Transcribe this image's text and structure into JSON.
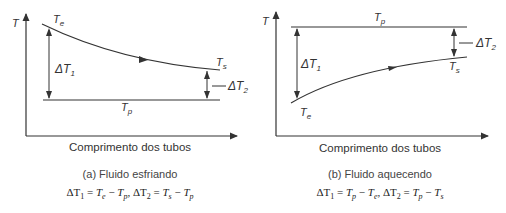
{
  "panels": [
    {
      "id": "a",
      "y_axis_label": "T",
      "x_axis_label": "Comprimento dos tubos",
      "caption": "(a) Fluido esfriando",
      "formula": "ΔT1 = Te − Tp, ΔT2 = Ts − Tp",
      "labels": {
        "te": "T",
        "te_sub": "e",
        "ts": "T",
        "ts_sub": "s",
        "tp": "T",
        "tp_sub": "p",
        "dt1": "ΔT",
        "dt1_sub": "1",
        "dt2": "ΔT",
        "dt2_sub": "2"
      },
      "formula_parts": {
        "d1": "ΔT",
        "d1s": "1",
        "eq1": " = ",
        "a1": "T",
        "a1s": "e",
        "m1": " − ",
        "b1": "T",
        "b1s": "p",
        "sep": ", ",
        "d2": "ΔT",
        "d2s": "2",
        "eq2": " = ",
        "a2": "T",
        "a2s": "s",
        "m2": " − ",
        "b2": "T",
        "b2s": "p"
      }
    },
    {
      "id": "b",
      "y_axis_label": "T",
      "x_axis_label": "Comprimento dos tubos",
      "caption": "(b) Fluido aquecendo",
      "formula": "ΔT1 = Tp − Te, ΔT2 = Tp − Ts",
      "labels": {
        "te": "T",
        "te_sub": "e",
        "ts": "T",
        "ts_sub": "s",
        "tp": "T",
        "tp_sub": "p",
        "dt1": "ΔT",
        "dt1_sub": "1",
        "dt2": "ΔT",
        "dt2_sub": "2"
      },
      "formula_parts": {
        "d1": "ΔT",
        "d1s": "1",
        "eq1": " = ",
        "a1": "T",
        "a1s": "p",
        "m1": " − ",
        "b1": "T",
        "b1s": "e",
        "sep": ", ",
        "d2": "ΔT",
        "d2s": "2",
        "eq2": " = ",
        "a2": "T",
        "a2s": "p",
        "m2": " − ",
        "b2": "T",
        "b2s": "s"
      }
    }
  ],
  "colors": {
    "line": "#333333",
    "text": "#333333"
  }
}
